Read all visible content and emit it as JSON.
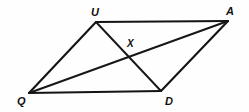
{
  "figure": {
    "name": "parallelogram-quad-with-diagonals",
    "background_color": "#fefefe",
    "stroke_color": "#141414",
    "width": 249,
    "height": 112,
    "labels": {
      "u": "U",
      "a": "A",
      "q": "Q",
      "d": "D",
      "x": "X"
    },
    "points": {
      "U": {
        "x": 96,
        "y": 22
      },
      "A": {
        "x": 228,
        "y": 21
      },
      "Q": {
        "x": 29,
        "y": 93
      },
      "D": {
        "x": 161,
        "y": 91
      },
      "X": {
        "x": 131,
        "y": 57
      }
    },
    "segments": [
      {
        "name": "side-UA",
        "from": "U",
        "to": "A"
      },
      {
        "name": "side-AD",
        "from": "A",
        "to": "D"
      },
      {
        "name": "side-DQ",
        "from": "D",
        "to": "Q"
      },
      {
        "name": "side-QU",
        "from": "Q",
        "to": "U"
      },
      {
        "name": "diagonal-QA",
        "from": "Q",
        "to": "A"
      },
      {
        "name": "diagonal-UD",
        "from": "U",
        "to": "D"
      }
    ]
  }
}
